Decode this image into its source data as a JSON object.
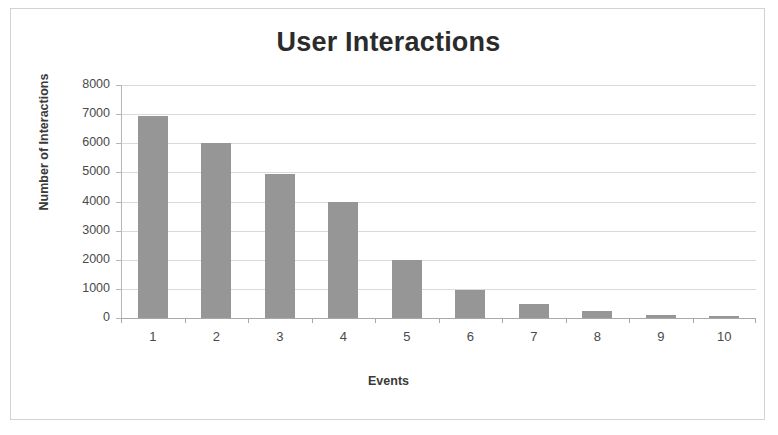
{
  "chart_data": {
    "type": "bar",
    "title": "User Interactions",
    "xlabel": "Events",
    "ylabel": "Number of Interactions",
    "categories": [
      "1",
      "2",
      "3",
      "4",
      "5",
      "6",
      "7",
      "8",
      "9",
      "10"
    ],
    "values": [
      6950,
      6000,
      4950,
      4000,
      2000,
      950,
      480,
      250,
      120,
      80
    ],
    "ylim": [
      0,
      8000
    ],
    "ytick_labels": [
      "8000",
      "7000",
      "6000",
      "5000",
      "4000",
      "3000",
      "2000",
      "1000",
      "0"
    ],
    "ytick_values": [
      8000,
      7000,
      6000,
      5000,
      4000,
      3000,
      2000,
      1000,
      0
    ],
    "grid": true,
    "legend": false,
    "series": [
      {
        "name": "Number of Interactions",
        "values": [
          6950,
          6000,
          4950,
          4000,
          2000,
          950,
          480,
          250,
          120,
          80
        ],
        "color": "#969696"
      }
    ]
  },
  "style": {
    "bar_color": "#969696",
    "gridline_color": "#d9d9d9",
    "axis_color": "#a8a8a8",
    "frame_color": "#d2d2d2",
    "text_color": "#404040",
    "background": "#ffffff"
  }
}
